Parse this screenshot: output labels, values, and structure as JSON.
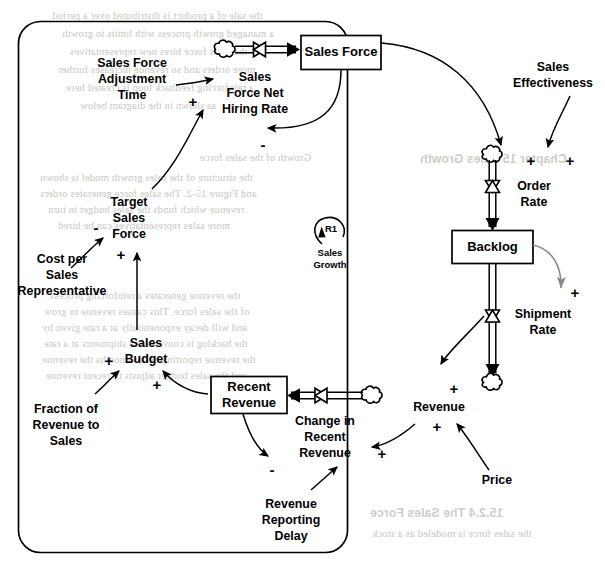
{
  "diagram": {
    "title": "Sales Growth",
    "loop_id": "R1",
    "loop_polarity": "reinforcing",
    "boundary_shape": "rounded-rectangle"
  },
  "colors": {
    "ink": "#000000",
    "gray_link": "#808080",
    "paper": "#ffffff",
    "bleed_text": "#c9c6c2"
  },
  "stocks": [
    {
      "id": "sales_force",
      "label": "Sales Force"
    },
    {
      "id": "backlog",
      "label": "Backlog"
    },
    {
      "id": "recent_revenue",
      "label": "Recent\nRevenue",
      "line1": "Recent",
      "line2": "Revenue"
    }
  ],
  "flows": [
    {
      "id": "sales_force_net_hiring_rate",
      "line1": "Sales",
      "line2": "Force Net",
      "line3": "Hiring Rate",
      "into": "sales_force",
      "from": "cloud"
    },
    {
      "id": "order_rate",
      "line1": "Order",
      "line2": "Rate",
      "into": "backlog",
      "from": "cloud"
    },
    {
      "id": "shipment_rate",
      "line1": "Shipment",
      "line2": "Rate",
      "from": "backlog",
      "into": "cloud"
    },
    {
      "id": "change_in_recent_revenue",
      "line1": "Change in",
      "line2": "Recent",
      "line3": "Revenue",
      "into": "recent_revenue",
      "from": "cloud"
    }
  ],
  "variables": [
    {
      "id": "sales_force_adjustment_time",
      "line1": "Sales Force",
      "line2": "Adjustment",
      "line3": "Time"
    },
    {
      "id": "target_sales_force",
      "line1": "Target",
      "line2": "Sales",
      "line3": "Force"
    },
    {
      "id": "cost_per_sales_representative",
      "line1": "Cost per",
      "line2": "Sales",
      "line3": "Representative"
    },
    {
      "id": "sales_budget",
      "line1": "Sales",
      "line2": "Budget"
    },
    {
      "id": "fraction_of_revenue_to_sales",
      "line1": "Fraction of",
      "line2": "Revenue to",
      "line3": "Sales"
    },
    {
      "id": "revenue_reporting_delay",
      "line1": "Revenue",
      "line2": "Reporting",
      "line3": "Delay"
    },
    {
      "id": "sales_effectiveness",
      "line1": "Sales",
      "line2": "Effectiveness"
    },
    {
      "id": "revenue",
      "line1": "Revenue"
    },
    {
      "id": "price",
      "line1": "Price"
    }
  ],
  "links": [
    {
      "id": "l_sfat_to_sfnhr",
      "from": "sales_force_adjustment_time",
      "to": "sales_force_net_hiring_rate",
      "polarity": ""
    },
    {
      "id": "l_tsf_to_sfnhr",
      "from": "target_sales_force",
      "to": "sales_force_net_hiring_rate",
      "polarity": "+"
    },
    {
      "id": "l_sf_to_sfnhr",
      "from": "sales_force",
      "to": "sales_force_net_hiring_rate",
      "polarity": "-"
    },
    {
      "id": "l_cpsr_to_tsf",
      "from": "cost_per_sales_representative",
      "to": "target_sales_force",
      "polarity": "-"
    },
    {
      "id": "l_sb_to_tsf",
      "from": "sales_budget",
      "to": "target_sales_force",
      "polarity": "+"
    },
    {
      "id": "l_forts_to_sb",
      "from": "fraction_of_revenue_to_sales",
      "to": "sales_budget",
      "polarity": "+"
    },
    {
      "id": "l_rr_to_sb",
      "from": "recent_revenue",
      "to": "sales_budget",
      "polarity": "+"
    },
    {
      "id": "l_rr_to_crr",
      "from": "recent_revenue",
      "to": "change_in_recent_revenue",
      "polarity": "-"
    },
    {
      "id": "l_rrd_to_crr",
      "from": "revenue_reporting_delay",
      "to": "change_in_recent_revenue",
      "polarity": ""
    },
    {
      "id": "l_rev_to_crr",
      "from": "revenue",
      "to": "change_in_recent_revenue",
      "polarity": "+"
    },
    {
      "id": "l_sf_to_or",
      "from": "sales_force",
      "to": "order_rate",
      "polarity": "+"
    },
    {
      "id": "l_se_to_or",
      "from": "sales_effectiveness",
      "to": "order_rate",
      "polarity": "+"
    },
    {
      "id": "l_bl_to_sr",
      "from": "backlog",
      "to": "shipment_rate",
      "polarity": "+"
    },
    {
      "id": "l_sr_to_rev",
      "from": "shipment_rate",
      "to": "revenue",
      "polarity": "+"
    },
    {
      "id": "l_price_to_rev",
      "from": "price",
      "to": "revenue",
      "polarity": "+"
    }
  ],
  "signs": {
    "plus": "+",
    "minus": "-"
  },
  "bleed_text": [
    {
      "t": "the sale of a product is distributed over a period",
      "x": 52,
      "y": 10
    },
    {
      "t": "a managed growth process with limits to growth",
      "x": 62,
      "y": 28
    },
    {
      "t": "the sales force hires new representatives",
      "x": 70,
      "y": 46
    },
    {
      "t": "more orders and so revenue increases further",
      "x": 58,
      "y": 64
    },
    {
      "t": "a reinforcing feedback loop is created here",
      "x": 66,
      "y": 82
    },
    {
      "t": "as shown in the diagram below",
      "x": 80,
      "y": 100
    },
    {
      "t": "Growth of the sales force",
      "x": 200,
      "y": 152
    },
    {
      "t": "the structure of the sales growth model is shown",
      "x": 40,
      "y": 172
    },
    {
      "t": "and Figure 15-2. The sales force generates orders",
      "x": 40,
      "y": 188
    },
    {
      "t": "revenue which funds the sales budget in turn",
      "x": 48,
      "y": 204
    },
    {
      "t": "more sales representatives can be hired",
      "x": 58,
      "y": 220
    },
    {
      "t": "the revenue generates a reinforcing process",
      "x": 50,
      "y": 290
    },
    {
      "t": "of the sales force. This causes revenue to grow",
      "x": 44,
      "y": 306
    },
    {
      "t": "and will decay exponentially at a rate given by",
      "x": 42,
      "y": 322
    },
    {
      "t": "the backlog is converted to shipments at a rate",
      "x": 44,
      "y": 338
    },
    {
      "t": "the revenue reporting delay smooths the revenue",
      "x": 42,
      "y": 354
    },
    {
      "t": "and the sales budget adjusts to recent revenue",
      "x": 46,
      "y": 370
    },
    {
      "t": "15.2.4  The Sales Force",
      "x": 370,
      "y": 506,
      "b2": true
    },
    {
      "t": "the sales force is modeled as a stock",
      "x": 372,
      "y": 528
    },
    {
      "t": "Chapter 15  Sales Growth",
      "x": 420,
      "y": 152,
      "b2": true
    }
  ]
}
